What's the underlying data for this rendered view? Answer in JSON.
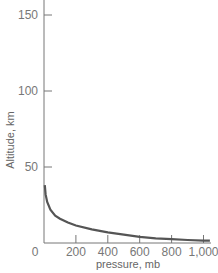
{
  "chart_data": {
    "type": "line",
    "title": "",
    "xlabel": "pressure, mb",
    "ylabel": "Altitude, km",
    "xlim": [
      0,
      1050
    ],
    "ylim": [
      0,
      155
    ],
    "x_ticks": [
      0,
      200,
      400,
      600,
      800,
      1000
    ],
    "x_tick_labels": [
      "0",
      "200",
      "400",
      "600",
      "800",
      "1,000"
    ],
    "y_ticks": [
      50,
      100,
      150
    ],
    "y_tick_labels": [
      "50",
      "100",
      "150"
    ],
    "grid": false,
    "legend": null,
    "series": [
      {
        "name": "altitude vs pressure",
        "color": "#555555",
        "x": [
          5,
          10,
          20,
          40,
          70,
          100,
          150,
          200,
          300,
          400,
          500,
          600,
          700,
          800,
          900,
          1000,
          1040
        ],
        "y": [
          38,
          32,
          27,
          22,
          18,
          16,
          13.5,
          11.5,
          9,
          7,
          5.5,
          4,
          3,
          2.5,
          2,
          1.5,
          1.5
        ]
      }
    ]
  }
}
